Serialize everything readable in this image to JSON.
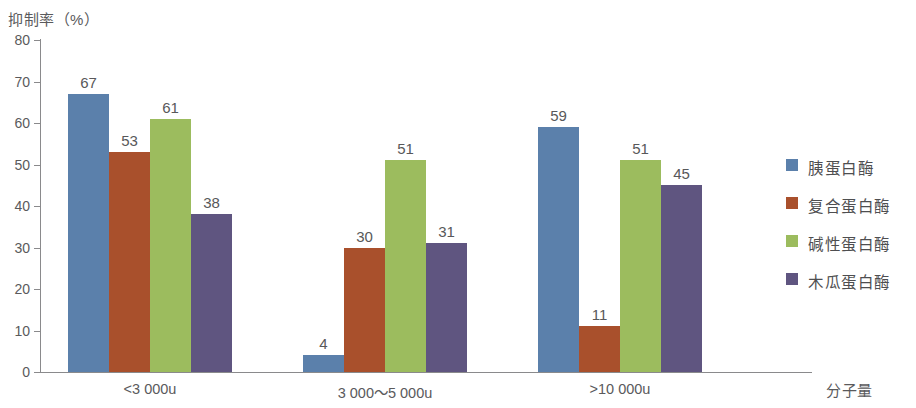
{
  "chart_data": {
    "type": "bar",
    "title": "",
    "xlabel": "分子量",
    "ylabel": "抑制率（%）",
    "ylim": [
      0,
      80
    ],
    "ytick_labels": [
      "80",
      "70",
      "60",
      "50",
      "40",
      "30",
      "20",
      "10",
      "0"
    ],
    "ytick_values": [
      80,
      70,
      60,
      50,
      40,
      30,
      20,
      10,
      0
    ],
    "grid": false,
    "legend_position": "right",
    "categories": [
      "<3 000u",
      "3 000～5 000u",
      ">10 000u"
    ],
    "series": [
      {
        "name": "胰蛋白酶",
        "color": "#5b80ab",
        "values": [
          67,
          4,
          59
        ]
      },
      {
        "name": "复合蛋白酶",
        "color": "#a9502c",
        "values": [
          53,
          30,
          11
        ]
      },
      {
        "name": "碱性蛋白酶",
        "color": "#9cbc5e",
        "values": [
          61,
          51,
          51
        ]
      },
      {
        "name": "木瓜蛋白酶",
        "color": "#5f5580",
        "values": [
          38,
          31,
          45
        ]
      }
    ],
    "data_labels": [
      [
        "67",
        "53",
        "61",
        "38"
      ],
      [
        "4",
        "30",
        "51",
        "31"
      ],
      [
        "59",
        "11",
        "51",
        "45"
      ]
    ]
  },
  "axis": {
    "y_title": "抑制率（%）",
    "x_title": "分子量"
  }
}
